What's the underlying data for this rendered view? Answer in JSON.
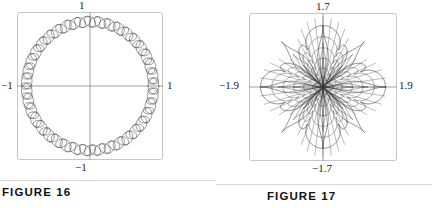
{
  "page": {
    "width": 432,
    "height": 208,
    "background": "#ffffff",
    "ink_color": "#3b3b3b",
    "frame_color": "#c6c6c6",
    "axis_color": "#8c8c8c",
    "text_color": "#121212"
  },
  "figures": [
    {
      "id": "figure-16",
      "caption": "FIGURE 16",
      "axis_labels": {
        "top": "1",
        "left": "−1",
        "right": "1",
        "bottom": "−1"
      },
      "chart_data": {
        "type": "line",
        "title": "FIGURE 16",
        "subtitle": "Braided annulus parametric curve",
        "xlabel": "",
        "ylabel": "",
        "xlim": [
          -1.15,
          1.15
        ],
        "ylim": [
          -1.15,
          1.15
        ],
        "xticks": [
          -1,
          1
        ],
        "yticks": [
          -1,
          1
        ],
        "xticklabels": [
          "−1",
          "1"
        ],
        "yticklabels": [
          "−1",
          "1"
        ],
        "grid": false,
        "legend": null,
        "axes_visible": true,
        "frame_visible": true,
        "series": [
          {
            "name": "outer braid strand",
            "param": "t",
            "t_range": [
              0,
              6.283185307179586
            ],
            "samples": 3000,
            "x_expr": "cos(t) + cos(40*t)/12",
            "y_expr": "sin(t) + sin(40*t)/12",
            "color": "#3b3b3b",
            "linewidth": 0.55
          },
          {
            "name": "inner braid strand",
            "param": "t",
            "t_range": [
              0,
              6.283185307179586
            ],
            "samples": 3000,
            "x_expr": "cos(t) - cos(40*t)/12",
            "y_expr": "sin(t) + sin(40*t)/12",
            "color": "#3b3b3b",
            "linewidth": 0.55
          }
        ],
        "description": "A circular ring of radius 1 drawn as a woven/braided band: two high-frequency cosine modulations of a unit circle cross each other repeatedly, producing roughly 40 lens-shaped cells around the annulus."
      }
    },
    {
      "id": "figure-17",
      "caption": "FIGURE 17",
      "axis_labels": {
        "top": "1.7",
        "left": "−1.9",
        "right": "1.9",
        "bottom": "−1.7"
      },
      "chart_data": {
        "type": "line",
        "title": "FIGURE 17",
        "subtitle": "Eight-petal nested rose curve",
        "xlabel": "",
        "ylabel": "",
        "xlim": [
          -2.25,
          2.25
        ],
        "ylim": [
          -2.05,
          2.05
        ],
        "xticks": [
          -1.9,
          1.9
        ],
        "yticks": [
          -1.7,
          1.7
        ],
        "xticklabels": [
          "−1.9",
          "1.9"
        ],
        "yticklabels": [
          "−1.7",
          "1.7"
        ],
        "grid": false,
        "legend": null,
        "axes_visible": true,
        "frame_visible": true,
        "series": [
          {
            "name": "outer rose",
            "param": "t",
            "t_range": [
              0,
              12.566370614359172
            ],
            "samples": 4000,
            "r_expr": "1.9 * |cos(2*t)|^0.35",
            "petals": 8,
            "color": "#3b3b3b",
            "linewidth": 0.6
          },
          {
            "name": "nested inner roses",
            "param": "t",
            "t_range": [
              0,
              12.566370614359172
            ],
            "samples": 4000,
            "scales": [
              0.82,
              0.64,
              0.47,
              0.31,
              0.17
            ],
            "petals": 8,
            "color": "#4a4a4a",
            "linewidth": 0.5
          },
          {
            "name": "radial spokes",
            "count": 48,
            "color": "#555555",
            "linewidth": 0.4
          }
        ],
        "description": "An eight-lobed rose (four long horizontal/vertical-diagonal petals plus diagonals) with several progressively smaller concentric copies nested inside each petal, and dense radial spokes converging at the origin."
      }
    }
  ],
  "footer": {
    "cropped_text": "• · · · · · · ·"
  }
}
